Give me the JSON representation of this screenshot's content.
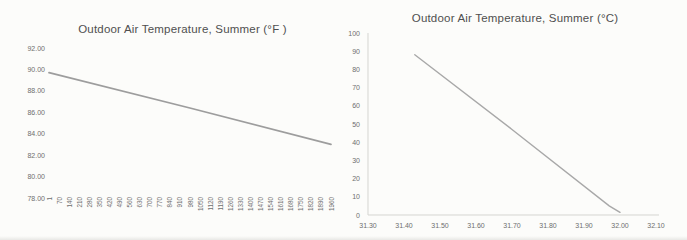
{
  "page": {
    "background": "#fcfcfa",
    "title_color": "#4f4f4f",
    "tick_label_color": "#6e6e6e"
  },
  "chart_data": [
    {
      "id": "fahrenheit-chart",
      "type": "line",
      "title": "Outdoor Air Temperature, Summer (°F )",
      "title_color": "#4f4f4f",
      "tick_color": "#6e6e6e",
      "axis_lines": false,
      "legend": false,
      "grid": false,
      "x_axis": {
        "kind": "category",
        "min": 1,
        "max": 1960,
        "tick_label_rotation": -90,
        "tick_labels": [
          "1",
          "70",
          "140",
          "210",
          "280",
          "350",
          "420",
          "490",
          "560",
          "630",
          "700",
          "770",
          "840",
          "910",
          "980",
          "1050",
          "1120",
          "1190",
          "1260",
          "1330",
          "1400",
          "1470",
          "1540",
          "1610",
          "1680",
          "1750",
          "1820",
          "1890",
          "1960"
        ]
      },
      "y_axis": {
        "min": 78,
        "max": 92,
        "step": 2,
        "tick_labels": [
          "78.00",
          "80.00",
          "82.00",
          "84.00",
          "86.00",
          "88.00",
          "90.00",
          "92.00"
        ]
      },
      "series": [
        {
          "name": "Outdoor Air Temperature (°F)",
          "color": "#9d9d9d",
          "width": 1.8,
          "points": [
            [
              1,
              89.7
            ],
            [
              980,
              86.4
            ],
            [
              1960,
              83.0
            ]
          ]
        }
      ]
    },
    {
      "id": "celsius-chart",
      "type": "line",
      "title": "Outdoor Air Temperature, Summer (°C)",
      "title_color": "#4f4f4f",
      "tick_color": "#6e6e6e",
      "axis_lines": true,
      "axis_line_color": "#d5d5d1",
      "legend": false,
      "grid": false,
      "x_axis": {
        "kind": "linear",
        "min": 31.3,
        "max": 32.1,
        "step": 0.1,
        "tick_labels": [
          "31.30",
          "31.40",
          "31.50",
          "31.60",
          "31.70",
          "31.80",
          "31.90",
          "32.00",
          "32.10"
        ]
      },
      "y_axis": {
        "min": 0,
        "max": 100,
        "step": 10,
        "tick_labels": [
          "0",
          "10",
          "20",
          "30",
          "40",
          "50",
          "60",
          "70",
          "80",
          "90",
          "100"
        ]
      },
      "series": [
        {
          "name": "Outdoor Air Temperature (°C)",
          "color": "#a8a8a8",
          "width": 1.4,
          "points": [
            [
              31.43,
              88
            ],
            [
              31.7,
              47
            ],
            [
              31.97,
              5
            ],
            [
              32.0,
              1.5
            ]
          ]
        }
      ]
    }
  ]
}
